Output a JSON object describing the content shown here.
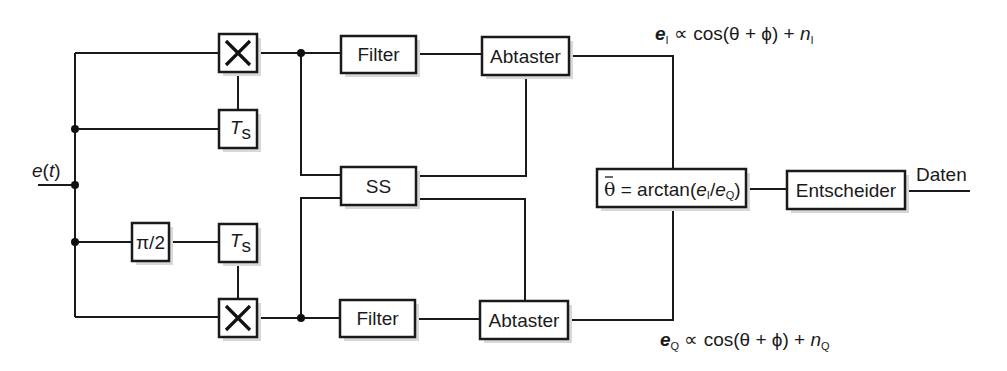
{
  "diagram": {
    "input_label": {
      "var": "e",
      "arg": "t"
    },
    "blocks": {
      "multiplier_top": {
        "symbol": "×"
      },
      "multiplier_bottom": {
        "symbol": "×"
      },
      "delay_top": {
        "main": "T",
        "sub": "s"
      },
      "delay_bottom": {
        "main": "T",
        "sub": "s"
      },
      "phase_shift": {
        "label": "π/2"
      },
      "filter_top": {
        "label": "Filter"
      },
      "filter_bottom": {
        "label": "Filter"
      },
      "sampler_top": {
        "label": "Abtaster"
      },
      "sampler_bottom": {
        "label": "Abtaster"
      },
      "sync": {
        "label": "SS"
      },
      "arctan": {
        "theta": "θ",
        "eq": " = arctan(",
        "e1": "e",
        "s1": "I",
        "slash": "/",
        "e2": "e",
        "s2": "Q",
        "close": ")"
      },
      "decider": {
        "label": "Entscheider"
      }
    },
    "output_label": "Daten",
    "eq_top": {
      "e": "e",
      "sub": "I",
      "rel": " ∝ cos(θ + ϕ) + ",
      "n": "n",
      "nsub": "I"
    },
    "eq_bottom": {
      "e": "e",
      "sub": "Q",
      "rel": " ∝ cos(θ + ϕ) + ",
      "n": "n",
      "nsub": "Q"
    }
  }
}
